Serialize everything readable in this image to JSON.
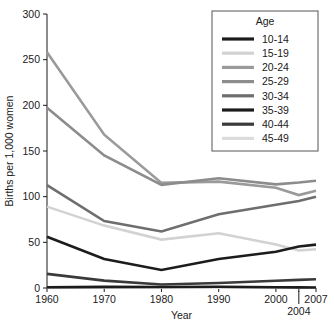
{
  "chart_data": {
    "type": "line",
    "title": "",
    "xlabel": "Year",
    "ylabel": "Births per 1,000 women",
    "x": [
      1960,
      1970,
      1980,
      1990,
      2000,
      2004,
      2007
    ],
    "xticklabels": [
      "1960",
      "1970",
      "1980",
      "1990",
      "2000",
      "2004",
      "2007"
    ],
    "yticklabels": [
      "0",
      "50",
      "100",
      "150",
      "200",
      "250",
      "300"
    ],
    "yticks": [
      0,
      50,
      100,
      150,
      200,
      250,
      300
    ],
    "xlim": [
      1960,
      2007
    ],
    "ylim": [
      0,
      300
    ],
    "grid": false,
    "legend_position": "top-right",
    "legend_title": "Age",
    "series": [
      {
        "name": "10-14",
        "color": "#1c1c1c",
        "width": 2.6,
        "values": [
          0.8,
          1.2,
          1.1,
          1.4,
          0.9,
          0.7,
          0.6
        ]
      },
      {
        "name": "15-19",
        "color": "#d2d2d2",
        "width": 2.6,
        "values": [
          89.1,
          68.3,
          53.0,
          59.9,
          47.7,
          41.1,
          42.5
        ]
      },
      {
        "name": "20-24",
        "color": "#9a9a9a",
        "width": 2.6,
        "values": [
          258.1,
          167.8,
          115.1,
          116.5,
          109.7,
          101.7,
          106.4
        ]
      },
      {
        "name": "25-29",
        "color": "#8c8c8c",
        "width": 2.6,
        "values": [
          197.4,
          145.1,
          112.9,
          120.2,
          113.5,
          115.5,
          117.5
        ]
      },
      {
        "name": "30-34",
        "color": "#6e6e6e",
        "width": 2.6,
        "values": [
          112.7,
          73.3,
          61.9,
          80.8,
          91.2,
          95.3,
          99.9
        ]
      },
      {
        "name": "35-39",
        "color": "#1c1c1c",
        "width": 2.6,
        "values": [
          56.2,
          31.7,
          19.8,
          31.7,
          39.7,
          45.4,
          47.5
        ]
      },
      {
        "name": "40-44",
        "color": "#3a3a3a",
        "width": 2.6,
        "values": [
          15.5,
          8.1,
          3.9,
          5.5,
          8.0,
          8.9,
          9.5
        ]
      },
      {
        "name": "45-49",
        "color": "#dcdcdc",
        "width": 2.6,
        "values": [
          0.9,
          0.5,
          0.2,
          0.2,
          0.5,
          0.5,
          0.6
        ]
      }
    ]
  },
  "axes": {
    "y_title": "Births per 1,000 women",
    "x_title": "Year",
    "y_ticks": [
      {
        "label": "300",
        "value": 300
      },
      {
        "label": "250",
        "value": 250
      },
      {
        "label": "200",
        "value": 200
      },
      {
        "label": "150",
        "value": 150
      },
      {
        "label": "100",
        "value": 100
      },
      {
        "label": "50",
        "value": 50
      },
      {
        "label": "0",
        "value": 0
      }
    ],
    "x_ticks": [
      {
        "label": "1960",
        "value": 1960,
        "offset_row": 0
      },
      {
        "label": "1970",
        "value": 1970,
        "offset_row": 0
      },
      {
        "label": "1980",
        "value": 1980,
        "offset_row": 0
      },
      {
        "label": "1990",
        "value": 1990,
        "offset_row": 0
      },
      {
        "label": "2000",
        "value": 2000,
        "offset_row": 0
      },
      {
        "label": "2004",
        "value": 2004,
        "offset_row": 1
      },
      {
        "label": "2007",
        "value": 2007,
        "offset_row": 0
      }
    ]
  },
  "legend": {
    "title": "Age",
    "entries": [
      {
        "label": "10-14",
        "color": "#1c1c1c"
      },
      {
        "label": "15-19",
        "color": "#d2d2d2"
      },
      {
        "label": "20-24",
        "color": "#9a9a9a"
      },
      {
        "label": "25-29",
        "color": "#8c8c8c"
      },
      {
        "label": "30-34",
        "color": "#6e6e6e"
      },
      {
        "label": "35-39",
        "color": "#1c1c1c"
      },
      {
        "label": "40-44",
        "color": "#3a3a3a"
      },
      {
        "label": "45-49",
        "color": "#dcdcdc"
      }
    ]
  }
}
